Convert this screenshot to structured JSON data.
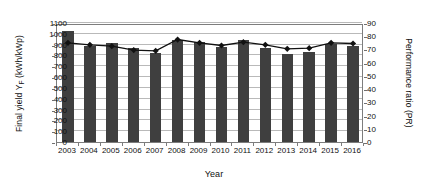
{
  "chart_data": {
    "type": "bar",
    "title": "",
    "xlabel": "Year",
    "ylabel": "Final yield YF (kWh/kWp)",
    "ylabel_right": "Performance ratio (PR)",
    "categories": [
      "2003",
      "2004",
      "2005",
      "2006",
      "2007",
      "2008",
      "2009",
      "2010",
      "2011",
      "2012",
      "2013",
      "2014",
      "2015",
      "2016"
    ],
    "ylim": [
      0,
      1100
    ],
    "ylim_right": [
      0,
      90
    ],
    "yticks": [
      0,
      100,
      200,
      300,
      400,
      500,
      600,
      700,
      800,
      900,
      1000,
      1100
    ],
    "yticks_right": [
      0,
      10,
      20,
      30,
      40,
      50,
      60,
      70,
      80,
      90
    ],
    "grid": true,
    "legend": "none",
    "series": [
      {
        "name": "Final yield YF (kWh/kWp)",
        "type": "bar",
        "axis": "left",
        "color": "#3f3f3f",
        "values": [
          1030,
          885,
          912,
          865,
          825,
          945,
          920,
          880,
          945,
          870,
          815,
          830,
          905,
          890
        ]
      },
      {
        "name": "Performance ratio (PR)",
        "type": "line",
        "axis": "right",
        "color": "#111111",
        "marker": "diamond",
        "values": [
          76.5,
          75.0,
          74.0,
          71.0,
          70.5,
          79.0,
          76.5,
          74.5,
          77.0,
          75.0,
          72.0,
          72.5,
          76.5,
          76.0
        ]
      }
    ]
  },
  "axis": {
    "left_title_main": "Final yield Y",
    "left_title_sub": "F",
    "left_title_unit": " (kWh/kWp)",
    "right_title": "Performance ratio (PR)",
    "x_title": "Year"
  }
}
